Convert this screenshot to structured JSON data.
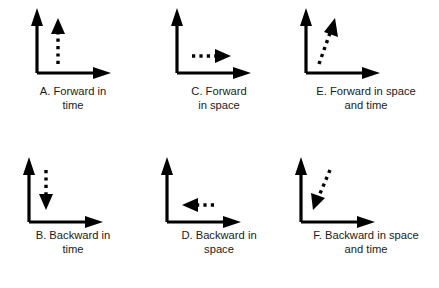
{
  "figure": {
    "background_color": "#ffffff",
    "ink_color": "#000000",
    "grid": {
      "rows": 2,
      "cols": 3
    }
  },
  "panels": [
    {
      "id": "A",
      "position": {
        "row": 1,
        "col": 1
      },
      "caption_line1": "A. Forward in",
      "caption_line2": "time",
      "axes": {
        "vertical_label": "time",
        "horizontal_label": "space",
        "style": "solid-L"
      },
      "motion_arrow": {
        "style": "dashed",
        "direction": "up",
        "dx": 0,
        "dy": -1,
        "meaning": "forward in time"
      }
    },
    {
      "id": "C",
      "position": {
        "row": 1,
        "col": 2
      },
      "caption_line1": "C. Forward",
      "caption_line2": "in space",
      "axes": {
        "vertical_label": "time",
        "horizontal_label": "space",
        "style": "solid-L"
      },
      "motion_arrow": {
        "style": "dashed",
        "direction": "right",
        "dx": 1,
        "dy": 0,
        "meaning": "forward in space"
      }
    },
    {
      "id": "E",
      "position": {
        "row": 1,
        "col": 3
      },
      "caption_line1": "E. Forward in space",
      "caption_line2": "and time",
      "axes": {
        "vertical_label": "time",
        "horizontal_label": "space",
        "style": "solid-L"
      },
      "motion_arrow": {
        "style": "dashed",
        "direction": "up-right",
        "dx": 0.35,
        "dy": -1,
        "meaning": "forward in space and time"
      }
    },
    {
      "id": "B",
      "position": {
        "row": 2,
        "col": 1
      },
      "caption_line1": "B. Backward in",
      "caption_line2": "time",
      "axes": {
        "vertical_label": "time",
        "horizontal_label": "space",
        "style": "solid-L"
      },
      "motion_arrow": {
        "style": "dashed",
        "direction": "down",
        "dx": 0,
        "dy": 1,
        "meaning": "backward in time"
      }
    },
    {
      "id": "D",
      "position": {
        "row": 2,
        "col": 2
      },
      "caption_line1": "D. Backward in",
      "caption_line2": "space",
      "axes": {
        "vertical_label": "time",
        "horizontal_label": "space",
        "style": "solid-L"
      },
      "motion_arrow": {
        "style": "dashed",
        "direction": "left",
        "dx": -1,
        "dy": 0,
        "meaning": "backward in space"
      }
    },
    {
      "id": "F",
      "position": {
        "row": 2,
        "col": 3
      },
      "caption_line1": "F. Backward in space",
      "caption_line2": "and time",
      "axes": {
        "vertical_label": "time",
        "horizontal_label": "space",
        "style": "solid-L"
      },
      "motion_arrow": {
        "style": "dashed",
        "direction": "down-left",
        "dx": -0.35,
        "dy": 1,
        "meaning": "backward in space and time"
      }
    }
  ]
}
